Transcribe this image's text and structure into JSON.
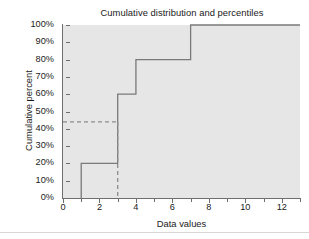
{
  "chart_data": {
    "type": "line",
    "subtype": "step-ecdf",
    "title": "Cumulative distribution and percentiles",
    "xlabel": "Data values",
    "ylabel": "Cumulative percent",
    "xlim": [
      0,
      13
    ],
    "ylim": [
      0,
      100
    ],
    "grid": false,
    "legend": "none",
    "background_color": "#e6e6e6",
    "line_color": "#7a7a7a",
    "dashed_color": "#8c8c8c",
    "x_ticks_major": [
      0,
      2,
      4,
      6,
      8,
      10,
      12
    ],
    "x_ticks_minor": [
      1,
      3,
      5,
      7,
      9,
      11,
      13
    ],
    "x_tick_labels": [
      "0",
      "2",
      "4",
      "6",
      "8",
      "10",
      "12"
    ],
    "y_ticks": [
      0,
      10,
      20,
      30,
      40,
      50,
      60,
      70,
      80,
      90,
      100
    ],
    "y_tick_labels": [
      "0%",
      "10%",
      "20%",
      "30%",
      "40%",
      "50%",
      "60%",
      "70%",
      "80%",
      "90%",
      "100%"
    ],
    "series": [
      {
        "name": "Cumulative distribution",
        "style": "step-post",
        "points": [
          {
            "x": 1,
            "y": 0
          },
          {
            "x": 1,
            "y": 20
          },
          {
            "x": 3,
            "y": 20
          },
          {
            "x": 3,
            "y": 60
          },
          {
            "x": 4,
            "y": 60
          },
          {
            "x": 4,
            "y": 80
          },
          {
            "x": 7,
            "y": 80
          },
          {
            "x": 7,
            "y": 100
          },
          {
            "x": 13,
            "y": 100
          }
        ]
      }
    ],
    "data_values": [
      1,
      3,
      3,
      4,
      7
    ],
    "step_jumps": [
      {
        "x": 1,
        "from": 0,
        "to": 20
      },
      {
        "x": 3,
        "from": 20,
        "to": 60
      },
      {
        "x": 4,
        "from": 60,
        "to": 80
      },
      {
        "x": 7,
        "from": 80,
        "to": 100
      }
    ],
    "annotations": [
      {
        "name": "percentile-guide",
        "style": "dashed",
        "horizontal": {
          "y": 44,
          "x_start": 0,
          "x_end": 3
        },
        "vertical": {
          "x": 3,
          "y_start": 44,
          "y_end": 0
        },
        "percentile": 44,
        "data_value": 3
      }
    ]
  }
}
